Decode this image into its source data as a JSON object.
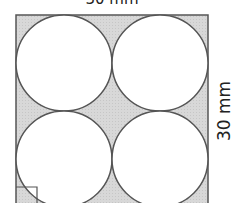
{
  "diagram": {
    "top_label": "30 mm",
    "side_label": "30 mm",
    "shape": "square with four inscribed equal circles",
    "colors": {
      "shaded_region": "#d6d6d6",
      "stroke": "#555555",
      "circle_fill": "#ffffff"
    }
  }
}
